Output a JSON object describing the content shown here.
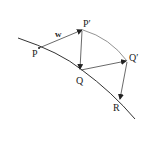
{
  "diagram": {
    "labels": {
      "P": "P",
      "P_prime": "P′",
      "Q": "Q",
      "Q_prime": "Q′",
      "R": "R",
      "w": "w"
    },
    "points": {
      "P": [
        39,
        48
      ],
      "P_prime": [
        83,
        30
      ],
      "Q": [
        80,
        70
      ],
      "Q_prime": [
        127,
        61
      ],
      "R": [
        119,
        100
      ]
    },
    "edges": [
      {
        "from": "P",
        "to": "P_prime",
        "arrow": true,
        "label": "w"
      },
      {
        "from": "P_prime",
        "to": "Q",
        "arrow": true
      },
      {
        "from": "Q",
        "to": "Q_prime",
        "arrow": true
      },
      {
        "from": "Q_prime",
        "to": "R",
        "arrow": true
      },
      {
        "from": "P_prime",
        "to": "Q_prime",
        "arrow": false,
        "curved": true
      }
    ],
    "curve": "main curve through P, Q, R"
  }
}
